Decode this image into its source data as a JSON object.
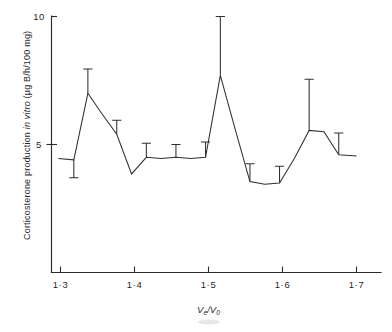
{
  "figure": {
    "caption_visible": false,
    "background_color": "#ffffff",
    "line_color": "#303030"
  },
  "chart_data": {
    "type": "line",
    "title": "",
    "subtitle": "",
    "xlabel": "Ve/V0",
    "xlabel_parts": {
      "v": "V",
      "sub_e": "e",
      "slash": "/",
      "v2": "V",
      "sub_0": "0"
    },
    "ylabel": "Corticosterone production in vitro (µg B/h/100 mg)",
    "ylabel_parts": {
      "lead": "Corticosterone production ",
      "italic": "in vitro",
      "tail": " (µg B/h/100 mg)"
    },
    "xlim": [
      1.28,
      1.73
    ],
    "ylim": [
      0,
      10
    ],
    "grid": false,
    "legend": null,
    "x_ticks": [
      1.3,
      1.4,
      1.5,
      1.6,
      1.7
    ],
    "x_tick_labels": [
      "1·3",
      "1·4",
      "1·5",
      "1·6",
      "1·7"
    ],
    "y_ticks": [
      5,
      10
    ],
    "y_tick_labels": [
      "5",
      "10"
    ],
    "series": [
      {
        "name": "Corticosterone production",
        "x": [
          1.297,
          1.318,
          1.337,
          1.356,
          1.376,
          1.396,
          1.416,
          1.436,
          1.456,
          1.476,
          1.496,
          1.516,
          1.536,
          1.556,
          1.576,
          1.596,
          1.616,
          1.636,
          1.656,
          1.676,
          1.7
        ],
        "values": [
          4.45,
          4.4,
          7.0,
          6.2,
          5.4,
          3.85,
          4.5,
          4.45,
          4.5,
          4.45,
          4.5,
          7.7,
          5.6,
          3.55,
          3.45,
          3.5,
          4.45,
          5.55,
          5.5,
          4.6,
          4.55
        ],
        "errors_up": [
          0.0,
          0.0,
          0.95,
          0.0,
          0.55,
          0.0,
          0.55,
          0.0,
          0.5,
          0.0,
          0.6,
          2.3,
          0.0,
          0.7,
          0.0,
          0.65,
          0.0,
          2.0,
          0.0,
          0.85,
          0.0
        ],
        "errors_down": [
          0.0,
          0.7,
          0.0,
          0.0,
          0.0,
          0.0,
          0.0,
          0.0,
          0.0,
          0.0,
          0.0,
          0.0,
          0.0,
          0.0,
          0.0,
          0.0,
          0.0,
          0.0,
          0.0,
          0.0,
          0.0
        ]
      }
    ]
  }
}
